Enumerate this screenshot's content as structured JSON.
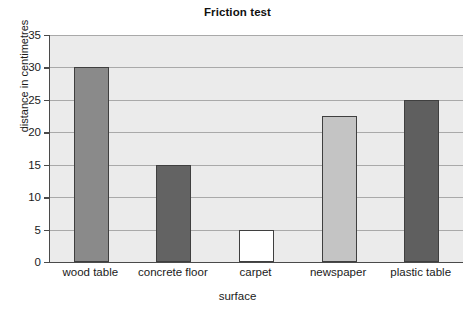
{
  "chart_data": {
    "type": "bar",
    "title": "Friction test",
    "xlabel": "surface",
    "ylabel": "distance in centimetres",
    "categories": [
      "wood table",
      "concrete floor",
      "carpet",
      "newspaper",
      "plastic table"
    ],
    "values": [
      30,
      15,
      5,
      22.5,
      25
    ],
    "bar_colors": [
      "#8a8a8a",
      "#636363",
      "#ffffff",
      "#c4c4c4",
      "#5f5f5f"
    ],
    "bar_edge_color": "#3f3f3f",
    "ylim": [
      0,
      35
    ],
    "yticks": [
      0,
      5,
      10,
      15,
      20,
      25,
      30,
      35
    ],
    "ytick_labels": [
      "0",
      "5",
      "10",
      "15",
      "20",
      "25",
      "30",
      "35"
    ],
    "grid": true,
    "grid_axis": "y",
    "grid_color": "#a9a9a9",
    "legend": false,
    "plot_background": "#ebebeb",
    "figure_background": "#ffffff",
    "axis_color": "#4a4a4a"
  }
}
